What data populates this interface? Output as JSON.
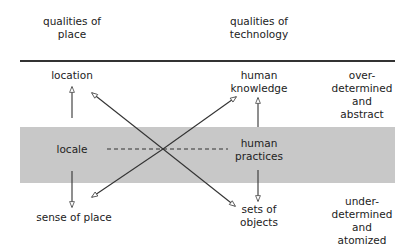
{
  "headers": {
    "place": [
      "qualities of",
      "place"
    ],
    "technology": [
      "qualities of",
      "technology"
    ]
  },
  "left_column": {
    "top": "location",
    "middle": "locale",
    "bottom": "sense of place"
  },
  "right_column": {
    "top": [
      "human",
      "knowledge"
    ],
    "middle": [
      "human",
      "practices"
    ],
    "bottom": [
      "sets of",
      "objects"
    ]
  },
  "side_labels": {
    "top": [
      "over-",
      "determined",
      "and",
      "abstract"
    ],
    "bottom": [
      "under-",
      "determined",
      "and",
      "atomized"
    ]
  },
  "colors": {
    "band": "#c8c8c8",
    "line": "#333333"
  }
}
